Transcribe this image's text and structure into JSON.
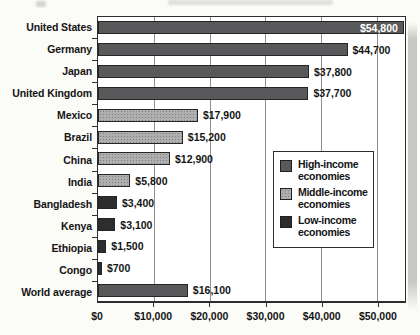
{
  "chart_data": {
    "type": "bar",
    "orientation": "horizontal",
    "title": "",
    "categories": [
      "United States",
      "Germany",
      "Japan",
      "United Kingdom",
      "Mexico",
      "Brazil",
      "China",
      "India",
      "Bangladesh",
      "Kenya",
      "Ethiopia",
      "Congo",
      "World average"
    ],
    "values": [
      54800,
      44700,
      37800,
      37700,
      17900,
      15200,
      12900,
      5800,
      3400,
      3100,
      1500,
      700,
      16100
    ],
    "value_labels": [
      "$54,800",
      "$44,700",
      "$37,800",
      "$37,700",
      "$17,900",
      "$15,200",
      "$12,900",
      "$5,800",
      "$3,400",
      "$3,100",
      "$1,500",
      "$700",
      "$16,100"
    ],
    "bar_groups": [
      "high",
      "high",
      "high",
      "high",
      "middle",
      "middle",
      "middle",
      "middle",
      "low",
      "low",
      "low",
      "low",
      "world"
    ],
    "label_inside": [
      true,
      false,
      false,
      false,
      false,
      false,
      false,
      false,
      false,
      false,
      false,
      false,
      false
    ],
    "xlabel": "",
    "ylabel": "",
    "xlim": [
      0,
      55000
    ],
    "x_ticks": [
      {
        "label": "$0",
        "value": 0
      },
      {
        "label": "$10,000",
        "value": 10000
      },
      {
        "label": "$20,000",
        "value": 20000
      },
      {
        "label": "$30,000",
        "value": 30000
      },
      {
        "label": "$40,000",
        "value": 40000
      },
      {
        "label": "$50,000",
        "value": 50000
      }
    ],
    "grid": "vertical-only",
    "legend_position": "center-right",
    "colors": {
      "high": "#59595b",
      "middle": "#aeaeae",
      "low": "#2d2d2f",
      "world": "#59595b"
    },
    "legend": [
      {
        "label": "High-income economies",
        "group": "high",
        "color": "#59595b"
      },
      {
        "label": "Middle-income economies",
        "group": "middle",
        "color": "#aeaeae"
      },
      {
        "label": "Low-income economies",
        "group": "low",
        "color": "#2d2d2f"
      }
    ]
  }
}
